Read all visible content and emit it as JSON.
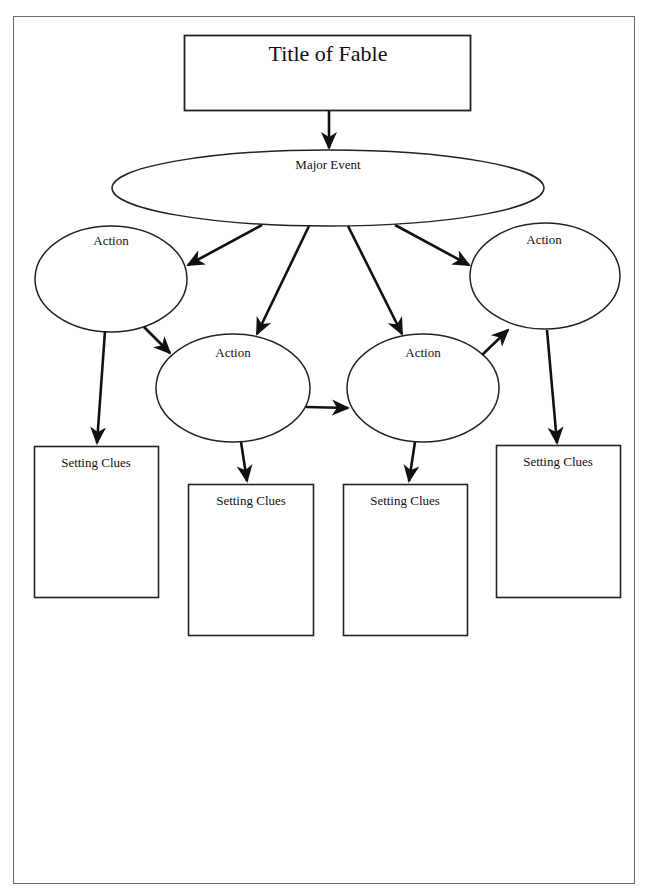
{
  "diagram": {
    "type": "story-map",
    "title_box": {
      "label": "Title of Fable"
    },
    "major_event": {
      "label": "Major Event"
    },
    "actions": [
      {
        "id": "action-1",
        "label": "Action"
      },
      {
        "id": "action-2",
        "label": "Action"
      },
      {
        "id": "action-3",
        "label": "Action"
      },
      {
        "id": "action-4",
        "label": "Action"
      }
    ],
    "setting_boxes": [
      {
        "id": "setting-1",
        "label": "Setting Clues"
      },
      {
        "id": "setting-2",
        "label": "Setting Clues"
      },
      {
        "id": "setting-3",
        "label": "Setting Clues"
      },
      {
        "id": "setting-4",
        "label": "Setting Clues"
      }
    ],
    "edges": [
      {
        "from": "title",
        "to": "major_event"
      },
      {
        "from": "major_event",
        "to": "action-1"
      },
      {
        "from": "major_event",
        "to": "action-2"
      },
      {
        "from": "major_event",
        "to": "action-3"
      },
      {
        "from": "major_event",
        "to": "action-4"
      },
      {
        "from": "action-1",
        "to": "action-2"
      },
      {
        "from": "action-2",
        "to": "action-3"
      },
      {
        "from": "action-3",
        "to": "action-4"
      },
      {
        "from": "action-1",
        "to": "setting-1"
      },
      {
        "from": "action-2",
        "to": "setting-2"
      },
      {
        "from": "action-3",
        "to": "setting-3"
      },
      {
        "from": "action-4",
        "to": "setting-4"
      }
    ],
    "colors": {
      "stroke": "#1a1a1a",
      "frame": "#6a6a6a",
      "background": "#ffffff"
    }
  }
}
